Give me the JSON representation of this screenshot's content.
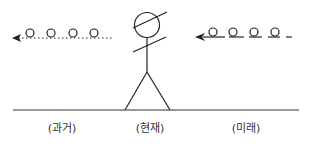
{
  "diagram": {
    "labels": {
      "past": "(과거)",
      "present": "(현재)",
      "future": "(미래)"
    },
    "colors": {
      "stroke": "#222222",
      "text": "#333333",
      "background": "#ffffff"
    }
  }
}
